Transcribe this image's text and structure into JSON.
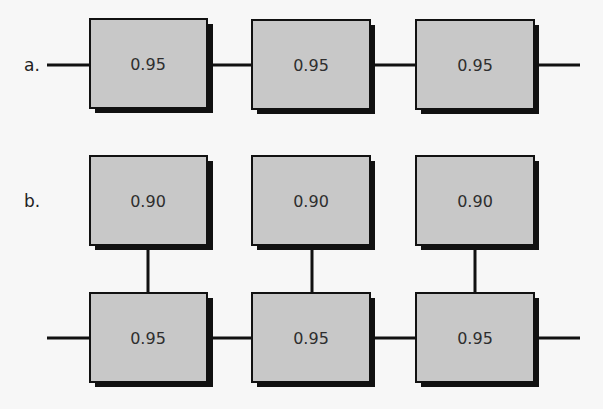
{
  "diagram": {
    "part_a": {
      "label": "a.",
      "description": "Three components in series",
      "components": [
        {
          "reliability": "0.95"
        },
        {
          "reliability": "0.95"
        },
        {
          "reliability": "0.95"
        }
      ]
    },
    "part_b": {
      "label": "b.",
      "description": "Three series components, each with a parallel backup",
      "backup_components": [
        {
          "reliability": "0.90"
        },
        {
          "reliability": "0.90"
        },
        {
          "reliability": "0.90"
        }
      ],
      "main_components": [
        {
          "reliability": "0.95"
        },
        {
          "reliability": "0.95"
        },
        {
          "reliability": "0.95"
        }
      ]
    },
    "colors": {
      "box_fill": "#c8c8c8",
      "line": "#111111",
      "background": "#f7f7f7"
    }
  }
}
